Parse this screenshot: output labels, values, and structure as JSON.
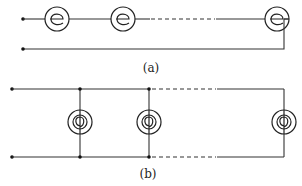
{
  "diagram": {
    "type": "circuit",
    "panels": [
      {
        "id": "a",
        "label": "(a)",
        "description": "Lamps connected in series",
        "lamps": 3,
        "has_ellipsis_dashes": true
      },
      {
        "id": "b",
        "label": "(b)",
        "description": "Lamps connected in parallel",
        "lamps": 3,
        "has_ellipsis_dashes": true
      }
    ],
    "colors": {
      "line": "#333333",
      "background": "#ffffff"
    }
  }
}
